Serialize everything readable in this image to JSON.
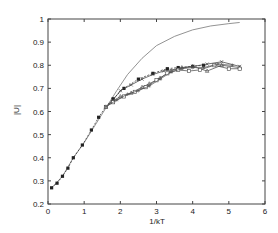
{
  "chart_data": {
    "type": "line",
    "title": "",
    "xlabel": "1/kT",
    "ylabel": "|U|",
    "xlim": [
      0,
      6
    ],
    "ylim": [
      0.2,
      1
    ],
    "xticks": [
      0,
      1,
      2,
      3,
      4,
      5,
      6
    ],
    "yticks": [
      0.2,
      0.3,
      0.4,
      0.5,
      0.6,
      0.7,
      0.8,
      0.9,
      1
    ],
    "ytick_labels": [
      "0.2",
      "0.3",
      "0.4",
      "0.5",
      "0.6",
      "0.7",
      "0.8",
      "0.9",
      "1"
    ],
    "grid": false,
    "legend": null,
    "series": [
      {
        "name": "theory",
        "style": "smooth-line",
        "color": "#777777",
        "x": [
          0.1,
          0.4,
          0.7,
          1.0,
          1.3,
          1.6,
          1.9,
          2.2,
          2.6,
          3.0,
          3.5,
          4.0,
          4.5,
          5.0,
          5.3
        ],
        "y": [
          0.27,
          0.32,
          0.4,
          0.465,
          0.54,
          0.615,
          0.69,
          0.76,
          0.83,
          0.885,
          0.925,
          0.953,
          0.97,
          0.98,
          0.985
        ]
      },
      {
        "name": "sim-filled-squares",
        "style": "dashed-markers",
        "marker": "square-filled",
        "color": "#222222",
        "x": [
          0.1,
          0.25,
          0.4,
          0.55,
          0.7,
          0.95,
          1.2,
          1.4,
          1.6,
          1.8,
          2.1,
          2.5,
          2.9,
          3.3,
          3.6,
          4.0,
          4.3
        ],
        "y": [
          0.27,
          0.29,
          0.32,
          0.355,
          0.4,
          0.455,
          0.52,
          0.575,
          0.62,
          0.655,
          0.7,
          0.74,
          0.765,
          0.785,
          0.79,
          0.795,
          0.8
        ]
      },
      {
        "name": "sim-crosses",
        "style": "line-markers",
        "marker": "cross",
        "color": "#333333",
        "x": [
          1.6,
          1.8,
          2.0,
          2.3,
          2.6,
          2.9,
          3.2,
          3.6,
          4.0,
          4.4,
          4.8,
          5.3
        ],
        "y": [
          0.62,
          0.65,
          0.69,
          0.715,
          0.74,
          0.76,
          0.775,
          0.785,
          0.795,
          0.805,
          0.815,
          0.795
        ]
      },
      {
        "name": "sim-triangles",
        "style": "line-markers",
        "marker": "triangle",
        "color": "#444444",
        "x": [
          1.6,
          1.8,
          2.0,
          2.3,
          2.6,
          2.8,
          3.1,
          3.4,
          3.7,
          4.0,
          4.4,
          4.8,
          5.3
        ],
        "y": [
          0.62,
          0.645,
          0.665,
          0.68,
          0.705,
          0.72,
          0.745,
          0.775,
          0.79,
          0.795,
          0.775,
          0.8,
          0.79
        ]
      },
      {
        "name": "sim-open-squares",
        "style": "line-markers",
        "marker": "square-open",
        "color": "#444444",
        "x": [
          1.6,
          1.8,
          2.1,
          2.4,
          2.7,
          3.0,
          3.3,
          3.6,
          3.9,
          4.2,
          4.6,
          5.0,
          5.3
        ],
        "y": [
          0.62,
          0.64,
          0.665,
          0.685,
          0.705,
          0.735,
          0.765,
          0.78,
          0.775,
          0.78,
          0.8,
          0.785,
          0.785
        ]
      },
      {
        "name": "sim-stars",
        "style": "line-markers",
        "marker": "star",
        "color": "#555555",
        "x": [
          1.6,
          1.9,
          2.2,
          2.5,
          2.8,
          3.1,
          3.4,
          3.7,
          4.0,
          4.3,
          4.7,
          5.1
        ],
        "y": [
          0.62,
          0.65,
          0.675,
          0.69,
          0.71,
          0.74,
          0.77,
          0.785,
          0.79,
          0.79,
          0.805,
          0.8
        ]
      }
    ]
  },
  "axes": {
    "xlabel": "1/kT",
    "ylabel": "|U|"
  }
}
